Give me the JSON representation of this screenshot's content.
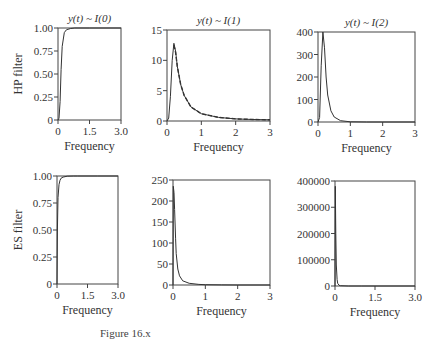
{
  "figure": {
    "row_labels": [
      "HP filter",
      "ES filter"
    ],
    "col_titles": [
      "y(t) ~ I(0)",
      "y(t) ~ I(1)",
      "y(t) ~ I(2)"
    ],
    "caption": "Figure 16.x"
  },
  "chart_data": [
    {
      "type": "line",
      "row": "HP filter",
      "title": "y(t) ~ I(0)",
      "xlabel": "Frequency",
      "ylabel": "HP filter",
      "xlim": [
        0,
        3.0
      ],
      "ylim": [
        0,
        1.0
      ],
      "xticks": [
        "0",
        "1.5",
        "3.0"
      ],
      "yticks": [
        "0",
        "0.25",
        "0.50",
        "0.75",
        "1.00"
      ],
      "series": [
        {
          "name": "gain",
          "style": "solid",
          "x": [
            0,
            0.05,
            0.1,
            0.15,
            0.2,
            0.3,
            0.4,
            0.6,
            0.8,
            1.0,
            1.5,
            2.0,
            3.0
          ],
          "y": [
            0,
            0.02,
            0.2,
            0.55,
            0.8,
            0.95,
            0.98,
            0.995,
            1.0,
            1.0,
            1.0,
            1.0,
            1.0
          ]
        }
      ]
    },
    {
      "type": "line",
      "row": "HP filter",
      "title": "y(t) ~ I(1)",
      "xlabel": "Frequency",
      "ylabel": "",
      "xlim": [
        0,
        3
      ],
      "ylim": [
        0,
        15
      ],
      "xticks": [
        "0",
        "1",
        "2",
        "3"
      ],
      "yticks": [
        "0",
        "5",
        "10",
        "15"
      ],
      "series": [
        {
          "name": "solid",
          "style": "solid",
          "x": [
            0,
            0.05,
            0.1,
            0.15,
            0.2,
            0.25,
            0.3,
            0.4,
            0.5,
            0.7,
            1.0,
            1.5,
            2.0,
            2.5,
            3.0
          ],
          "y": [
            0,
            0.5,
            4,
            10,
            12.8,
            11.5,
            9,
            6,
            4.2,
            2.3,
            1.2,
            0.6,
            0.35,
            0.25,
            0.2
          ]
        },
        {
          "name": "dashed",
          "style": "dashed",
          "x": [
            0.2,
            0.25,
            0.3,
            0.4,
            0.5,
            0.7,
            1.0,
            1.5,
            2.0,
            2.5,
            3.0
          ],
          "y": [
            12.5,
            11.3,
            9,
            6,
            4.2,
            2.3,
            1.2,
            0.6,
            0.35,
            0.25,
            0.2
          ]
        }
      ]
    },
    {
      "type": "line",
      "row": "HP filter",
      "title": "y(t) ~ I(2)",
      "xlabel": "Frequency",
      "ylabel": "",
      "xlim": [
        0,
        3
      ],
      "ylim": [
        0,
        400
      ],
      "xticks": [
        "0",
        "1",
        "2",
        "3"
      ],
      "yticks": [
        "0",
        "100",
        "200",
        "300",
        "400"
      ],
      "series": [
        {
          "name": "gain",
          "style": "solid",
          "x": [
            0,
            0.05,
            0.1,
            0.15,
            0.2,
            0.25,
            0.3,
            0.4,
            0.5,
            0.7,
            1.0,
            1.5,
            2.0,
            3.0
          ],
          "y": [
            0,
            20,
            250,
            400,
            330,
            200,
            120,
            50,
            22,
            6,
            1,
            0,
            0,
            0
          ]
        }
      ]
    },
    {
      "type": "line",
      "row": "ES filter",
      "title": "",
      "xlabel": "Frequency",
      "ylabel": "ES filter",
      "xlim": [
        0,
        3.0
      ],
      "ylim": [
        0,
        1.0
      ],
      "xticks": [
        "0",
        "1.5",
        "3.0"
      ],
      "yticks": [
        "0",
        "0.25",
        "0.50",
        "0.75",
        "1.00"
      ],
      "series": [
        {
          "name": "gain",
          "style": "solid",
          "x": [
            0,
            0.02,
            0.05,
            0.1,
            0.15,
            0.2,
            0.3,
            0.5,
            0.8,
            1.0,
            2.0,
            3.0
          ],
          "y": [
            0,
            0.5,
            0.8,
            0.92,
            0.96,
            0.98,
            0.99,
            0.998,
            1.0,
            1.0,
            1.0,
            1.0
          ]
        }
      ]
    },
    {
      "type": "line",
      "row": "ES filter",
      "title": "",
      "xlabel": "Frequency",
      "ylabel": "",
      "xlim": [
        0,
        3
      ],
      "ylim": [
        0,
        250
      ],
      "xticks": [
        "0",
        "1",
        "2",
        "3"
      ],
      "yticks": [
        "0",
        "50",
        "100",
        "150",
        "200",
        "250"
      ],
      "series": [
        {
          "name": "gain",
          "style": "solid",
          "x": [
            0,
            0.01,
            0.03,
            0.05,
            0.08,
            0.1,
            0.15,
            0.2,
            0.3,
            0.5,
            0.8,
            1.0,
            1.5,
            2.0,
            3.0
          ],
          "y": [
            0,
            235,
            220,
            180,
            110,
            75,
            38,
            22,
            10,
            4,
            1.5,
            0.8,
            0.3,
            0.1,
            0
          ]
        }
      ]
    },
    {
      "type": "line",
      "row": "ES filter",
      "title": "",
      "xlabel": "Frequency",
      "ylabel": "",
      "xlim": [
        0,
        3.0
      ],
      "ylim": [
        0,
        400000
      ],
      "xticks": [
        "0",
        "1.5",
        "3.0"
      ],
      "yticks": [
        "0",
        "100000",
        "200000",
        "300000",
        "400000"
      ],
      "series": [
        {
          "name": "gain",
          "style": "solid",
          "x": [
            0,
            0.01,
            0.03,
            0.05,
            0.08,
            0.1,
            0.15,
            0.2,
            0.5,
            1.0,
            3.0
          ],
          "y": [
            0,
            380000,
            200000,
            80000,
            25000,
            10000,
            3000,
            1000,
            100,
            0,
            0
          ]
        }
      ]
    }
  ]
}
